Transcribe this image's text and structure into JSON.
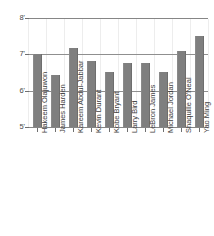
{
  "chart_data": {
    "type": "bar",
    "title": "",
    "subtitle": "",
    "xlabel": "",
    "ylabel": "",
    "ylim": [
      5,
      8
    ],
    "grid": true,
    "legend": "none",
    "orientation": "vertical",
    "bar_color": "#7f7f7f",
    "units": "feet",
    "categories": [
      "Hakeem Olajuwon",
      "James Harden",
      "Kareem Abdul-Jabbar",
      "Kevin Durant",
      "Kobe Bryant",
      "Larry Bird",
      "LeBron James",
      "Michael Jordan",
      "Shaquille O'Neal",
      "Yao Ming"
    ],
    "values": [
      7.0,
      6.42,
      7.17,
      6.83,
      6.5,
      6.75,
      6.75,
      6.5,
      7.08,
      7.5
    ],
    "value_labels": [
      "7'0\"",
      "6'5\"",
      "7'2\"",
      "6'10\"",
      "6'6\"",
      "6'9\"",
      "6'9\"",
      "6'6\"",
      "7'1\"",
      "7'6\""
    ],
    "y_ticks": [
      5,
      6,
      7,
      8
    ],
    "y_tick_labels": [
      "5'",
      "6'",
      "7'",
      "8'"
    ],
    "gridline_values": [
      6,
      7,
      8
    ]
  },
  "axes": {
    "y_axis": {
      "ticks": [
        {
          "value": 8,
          "label": "8'"
        },
        {
          "value": 7,
          "label": "7'"
        },
        {
          "value": 6,
          "label": "6'"
        },
        {
          "value": 5,
          "label": "5'"
        }
      ]
    }
  },
  "colors": {
    "bar": "#7f7f7f",
    "axis": "#868686",
    "gridline": "#8f8f8f",
    "vertical_gridline": "#ededed",
    "text": "#3f3f3f",
    "background": "#ffffff"
  }
}
